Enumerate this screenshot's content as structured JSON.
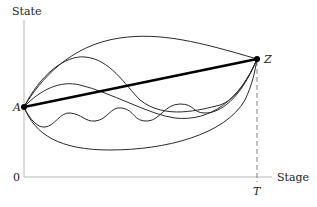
{
  "diagram": {
    "y_axis_label": "State",
    "x_axis_label": "Stage",
    "origin_label": "0",
    "terminal_stage_label": "T",
    "initial_point_label": "A",
    "terminal_point_label": "Z",
    "alternative_paths_count": 5,
    "optimal_path": "straight line from A to Z"
  },
  "colors": {
    "axis": "#b8b8b8",
    "path": "#2a2a2a",
    "optimal_path": "#000000"
  }
}
